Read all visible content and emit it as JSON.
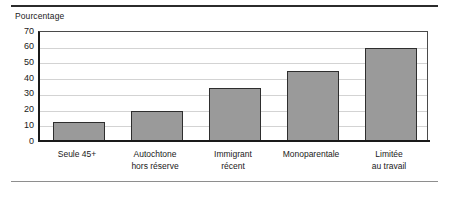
{
  "chart_data": {
    "type": "bar",
    "title": "",
    "ylabel": "Pourcentage",
    "xlabel": "",
    "categories": [
      "Seule 45+",
      "Autochtone hors réserve",
      "Immigrant récent",
      "Monoparentale",
      "Limitée au travail"
    ],
    "category_lines": [
      [
        "Seule 45+"
      ],
      [
        "Autochtone",
        "hors réserve"
      ],
      [
        "Immigrant",
        "récent"
      ],
      [
        "Monoparentale"
      ],
      [
        "Limitée",
        "au travail"
      ]
    ],
    "values": [
      12,
      19,
      33.5,
      44.5,
      59
    ],
    "ylim": [
      0,
      70
    ],
    "yticks": [
      0,
      10,
      20,
      30,
      40,
      50,
      60,
      70
    ],
    "ytick_labels": [
      "0",
      "10",
      "20",
      "30",
      "40",
      "50",
      "60",
      "70"
    ],
    "grid": true,
    "legend": false,
    "bar_color": "#9a9a9a",
    "bar_border_color": "#2e2e2e",
    "gridline_color": "#d3d3d3",
    "axis_color": "#1a1a1a",
    "text_color": "#1a1a1a"
  }
}
